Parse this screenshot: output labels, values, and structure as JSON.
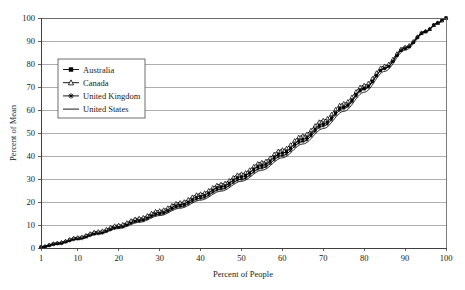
{
  "chart_data": {
    "type": "line",
    "title": "",
    "xlabel": "Percent of People",
    "ylabel": "Percent of Mean",
    "xlim": [
      1,
      100
    ],
    "ylim": [
      0,
      100
    ],
    "xticks": [
      1,
      10,
      20,
      30,
      40,
      50,
      60,
      70,
      80,
      90,
      100
    ],
    "yticks": [
      0,
      10,
      20,
      30,
      40,
      50,
      60,
      70,
      80,
      90,
      100
    ],
    "grid": "horizontal",
    "legend_position": "upper-left-inside",
    "x": [
      1,
      5,
      10,
      15,
      20,
      25,
      30,
      35,
      40,
      45,
      50,
      55,
      60,
      65,
      70,
      75,
      80,
      85,
      90,
      95,
      98,
      100
    ],
    "series": [
      {
        "name": "Australia",
        "marker": "filled-square",
        "values": [
          0.4,
          2.0,
          4.3,
          6.8,
          9.5,
          12.4,
          15.5,
          18.9,
          22.6,
          26.6,
          31.0,
          35.9,
          41.3,
          47.3,
          54.0,
          61.4,
          69.5,
          78.2,
          86.8,
          94.0,
          97.8,
          100.0
        ]
      },
      {
        "name": "Canada",
        "marker": "open-triangle",
        "values": [
          0.5,
          2.2,
          4.6,
          7.2,
          10.0,
          13.0,
          16.3,
          19.8,
          23.6,
          27.8,
          32.3,
          37.3,
          42.8,
          48.9,
          55.6,
          62.9,
          70.8,
          79.2,
          87.4,
          94.3,
          97.9,
          100.0
        ]
      },
      {
        "name": "United Kingdom",
        "marker": "star",
        "values": [
          0.3,
          1.8,
          3.9,
          6.3,
          8.9,
          11.7,
          14.7,
          18.0,
          21.6,
          25.6,
          29.9,
          34.8,
          40.2,
          46.3,
          53.1,
          60.7,
          69.0,
          78.0,
          86.9,
          94.2,
          97.9,
          100.0
        ]
      },
      {
        "name": "United States",
        "marker": "line",
        "values": [
          0.3,
          1.7,
          3.7,
          6.0,
          8.5,
          11.2,
          14.1,
          17.3,
          20.8,
          24.7,
          29.0,
          33.8,
          39.2,
          45.2,
          51.9,
          59.4,
          67.7,
          76.8,
          86.0,
          93.8,
          97.7,
          100.0
        ]
      }
    ]
  },
  "axes": {
    "y_title": "Percent of Mean",
    "x_title": "Percent of People",
    "y_tick_labels": [
      "100",
      "90",
      "80",
      "70",
      "60",
      "50",
      "40",
      "30",
      "20",
      "10",
      "0"
    ],
    "x_tick_labels": [
      "1",
      "10",
      "20",
      "30",
      "40",
      "50",
      "60",
      "70",
      "80",
      "90",
      "100"
    ]
  },
  "legend": {
    "items": [
      {
        "label": "Australia",
        "marker": "filled-square"
      },
      {
        "label": "Canada",
        "marker": "open-triangle"
      },
      {
        "label": "United Kingdom",
        "marker": "star"
      },
      {
        "label": "United States",
        "marker": "line"
      }
    ]
  },
  "colors": {
    "series": "#000000",
    "grid": "#8a8a8a",
    "axis": "#3a3a3a",
    "background": "#ffffff"
  }
}
